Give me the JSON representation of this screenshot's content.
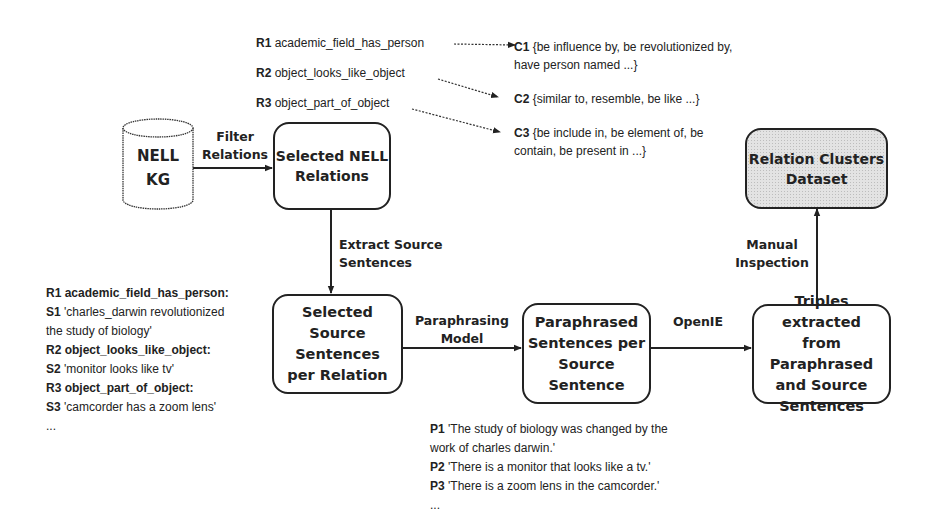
{
  "nodes": {
    "nell_kg": {
      "line1": "NELL",
      "line2": "KG"
    },
    "selected_nell_relations": {
      "line1": "Selected NELL",
      "line2": "Relations"
    },
    "relation_clusters_dataset": {
      "line1": "Relation Clusters",
      "line2": "Dataset"
    },
    "selected_source_sentences": {
      "line1": "Selected Source",
      "line2": "Sentences",
      "line3": "per Relation"
    },
    "paraphrased_sentences": {
      "line1": "Paraphrased",
      "line2": "Sentences per",
      "line3": "Source",
      "line4": "Sentence"
    },
    "triples_extracted": {
      "line1": "Triples extracted",
      "line2": "from Paraphrased",
      "line3": "and Source",
      "line4": "Sentences"
    }
  },
  "edges": {
    "filter_relations": {
      "line1": "Filter",
      "line2": "Relations"
    },
    "extract_source_sentences": {
      "line1": "Extract Source",
      "line2": "Sentences"
    },
    "paraphrasing_model": {
      "line1": "Paraphrasing",
      "line2": "Model"
    },
    "openie": {
      "line1": "OpenIE"
    },
    "manual_inspection": {
      "line1": "Manual",
      "line2": "Inspection"
    }
  },
  "relations": [
    {
      "id": "R1",
      "name": "academic_field_has_person"
    },
    {
      "id": "R2",
      "name": "object_looks_like_object"
    },
    {
      "id": "R3",
      "name": "object_part_of_object"
    }
  ],
  "clusters": [
    {
      "id": "C1",
      "line1": "{be influence by, be revolutionized by,",
      "line2": "have person named  ...}"
    },
    {
      "id": "C2",
      "line1": "{similar to, resemble, be like ...}"
    },
    {
      "id": "C3",
      "line1": "{be include in, be element of, be",
      "line2": "contain, be present in ...}"
    }
  ],
  "source_examples": [
    {
      "id": "R1",
      "text": "academic_field_has_person:",
      "bold": true
    },
    {
      "id": "S1",
      "text": "'charles_darwin revolutionized"
    },
    {
      "id": "",
      "text": "the study of biology'"
    },
    {
      "id": "R2",
      "text": "object_looks_like_object:",
      "bold": true
    },
    {
      "id": "S2",
      "text": "'monitor looks like tv'"
    },
    {
      "id": "R3",
      "text": "object_part_of_object:",
      "bold": true
    },
    {
      "id": "S3",
      "text": "'camcorder has a zoom lens'"
    },
    {
      "id": "",
      "text": "..."
    }
  ],
  "paraphrase_examples": [
    {
      "id": "P1",
      "text": "'The study of biology was changed by the"
    },
    {
      "id": "",
      "text": "work of charles darwin.'"
    },
    {
      "id": "P2",
      "text": "'There is a monitor that looks like a tv.'"
    },
    {
      "id": "P3",
      "text": "'There is a zoom lens in the camcorder.'"
    },
    {
      "id": "",
      "text": "..."
    }
  ]
}
